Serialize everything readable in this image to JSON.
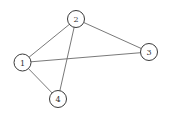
{
  "graph": {
    "nodes": [
      {
        "id": "1",
        "label": "1",
        "x": 22.5,
        "y": 62.5
      },
      {
        "id": "2",
        "label": "2",
        "x": 76,
        "y": 19
      },
      {
        "id": "3",
        "label": "3",
        "x": 149,
        "y": 52
      },
      {
        "id": "4",
        "label": "4",
        "x": 58,
        "y": 99
      }
    ],
    "edges": [
      {
        "from": "1",
        "to": "2"
      },
      {
        "from": "1",
        "to": "3"
      },
      {
        "from": "1",
        "to": "4"
      },
      {
        "from": "2",
        "to": "3"
      },
      {
        "from": "2",
        "to": "4"
      }
    ],
    "node_radius": 8.5,
    "colors": {
      "edge": "#6a6a6a",
      "node_stroke": "#3a3a3a",
      "label": "#333333",
      "background": "#ffffff"
    }
  }
}
